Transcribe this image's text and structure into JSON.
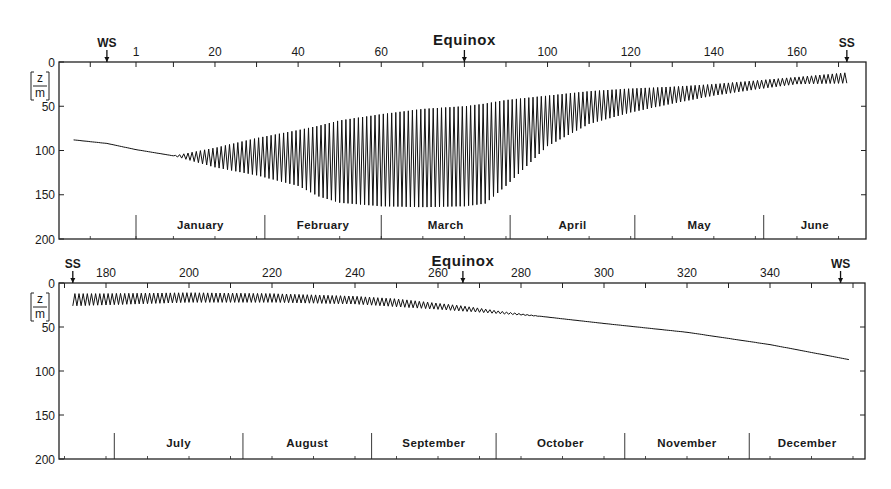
{
  "chart_data": [
    {
      "type": "line",
      "panel": "top",
      "title": "",
      "xlabel": "Day of year",
      "ylabel": "[z/m]",
      "ylabel_top": "z",
      "ylabel_bottom": "m",
      "y_inverted": true,
      "ylim": [
        0,
        200
      ],
      "y_ticks": [
        "0",
        "50",
        "100",
        "150",
        "200"
      ],
      "x_ticks": [
        "1",
        "20",
        "40",
        "60",
        "100",
        "120",
        "140",
        "160"
      ],
      "x_tick_days": [
        1,
        20,
        40,
        60,
        100,
        120,
        140,
        160
      ],
      "xlim_days": [
        -17,
        177
      ],
      "markers": [
        {
          "label": "WS",
          "day": -6
        },
        {
          "label": "Equinox",
          "day": 80
        },
        {
          "label": "SS",
          "day": 172
        }
      ],
      "months": [
        "January",
        "February",
        "March",
        "April",
        "May",
        "June"
      ],
      "month_start_days": [
        1,
        32,
        60,
        91,
        121,
        152
      ],
      "series": [
        {
          "name": "mixed layer depth (envelope)",
          "description": "Depth oscillates daily between a shallow (upper) and a deep (lower) envelope; single line before ~day 10",
          "x_days": [
            -14,
            -6,
            1,
            10,
            20,
            30,
            40,
            45,
            50,
            60,
            70,
            80,
            85,
            90,
            100,
            110,
            120,
            130,
            140,
            150,
            160,
            172
          ],
          "upper_depth_m": [
            88,
            92,
            99,
            106,
            97,
            86,
            77,
            72,
            66,
            59,
            53,
            50,
            47,
            43,
            38,
            33,
            30,
            28,
            25,
            21,
            17,
            12
          ],
          "lower_depth_m": [
            88,
            92,
            99,
            106,
            119,
            128,
            140,
            152,
            159,
            163,
            164,
            163,
            160,
            140,
            95,
            70,
            57,
            47,
            38,
            31,
            25,
            24
          ]
        }
      ]
    },
    {
      "type": "line",
      "panel": "bottom",
      "title": "",
      "xlabel": "Day of year",
      "ylabel": "[z/m]",
      "ylabel_top": "z",
      "ylabel_bottom": "m",
      "y_inverted": true,
      "ylim": [
        0,
        200
      ],
      "y_ticks": [
        "0",
        "50",
        "100",
        "150",
        "200"
      ],
      "x_ticks": [
        "180",
        "200",
        "220",
        "240",
        "260",
        "280",
        "300",
        "320",
        "340"
      ],
      "x_tick_days": [
        180,
        200,
        220,
        240,
        260,
        280,
        300,
        320,
        340
      ],
      "xlim_days": [
        163,
        367
      ],
      "markers": [
        {
          "label": "SS",
          "day": 172
        },
        {
          "label": "Equinox",
          "day": 266
        },
        {
          "label": "WS",
          "day": 357
        }
      ],
      "months": [
        "July",
        "August",
        "September",
        "October",
        "November",
        "December"
      ],
      "month_start_days": [
        182,
        213,
        244,
        274,
        305,
        335
      ],
      "series": [
        {
          "name": "mixed layer depth (envelope)",
          "description": "Shallow daily oscillation in summer, damping out by ~day 285, then smooth deepening",
          "x_days": [
            172,
            180,
            200,
            220,
            240,
            250,
            260,
            266,
            275,
            285,
            300,
            320,
            340,
            359
          ],
          "upper_depth_m": [
            12,
            12,
            11,
            12,
            15,
            18,
            23,
            26,
            32,
            38,
            46,
            56,
            70,
            87
          ],
          "lower_depth_m": [
            26,
            25,
            22,
            22,
            24,
            27,
            30,
            32,
            35,
            38,
            46,
            56,
            70,
            87
          ]
        }
      ]
    }
  ],
  "labels": {
    "equinox": "Equinox",
    "ws": "WS",
    "ss": "SS"
  }
}
